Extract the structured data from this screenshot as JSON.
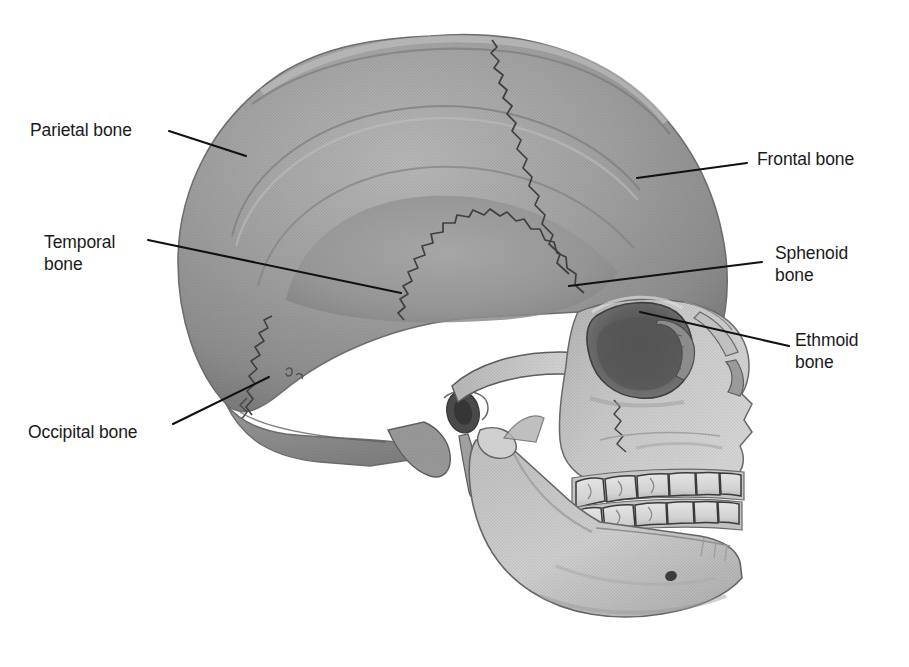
{
  "figure": {
    "type": "anatomical-illustration",
    "style": "grayscale halftone medical illustration",
    "orientation": "left lateral view, facing right",
    "background_color": "#ffffff",
    "line_color": "#111111",
    "text_color": "#1a1a1a",
    "tones": {
      "cranium_main": "#9b9b9b",
      "cranium_highlight": "#b0b0b0",
      "cranium_shadow": "#7d7d7d",
      "temporal_fossa": "#8d8d8d",
      "facial_bone_light": "#c9c9c9",
      "orbit_dark": "#5e5e5e",
      "tooth": "#dcdcdc",
      "suture": "#4a4a4a"
    }
  },
  "labels": [
    {
      "id": "parietal",
      "text": "Parietal bone",
      "side": "left",
      "text_x": 30,
      "text_y": 119,
      "leader": {
        "x1": 169,
        "y1": 131,
        "x2": 246,
        "y2": 156
      }
    },
    {
      "id": "temporal",
      "text": "Temporal\nbone",
      "side": "left",
      "text_x": 44,
      "text_y": 231,
      "leader": {
        "x1": 148,
        "y1": 240,
        "x2": 401,
        "y2": 293
      }
    },
    {
      "id": "occipital",
      "text": "Occipital bone",
      "side": "left",
      "text_x": 28,
      "text_y": 421,
      "leader": {
        "x1": 173,
        "y1": 424,
        "x2": 269,
        "y2": 377
      }
    },
    {
      "id": "frontal",
      "text": "Frontal bone",
      "side": "right",
      "text_x": 757,
      "text_y": 148,
      "leader": {
        "x1": 637,
        "y1": 178,
        "x2": 747,
        "y2": 163
      }
    },
    {
      "id": "sphenoid",
      "text": "Sphenoid\nbone",
      "side": "right",
      "text_x": 775,
      "text_y": 242,
      "leader": {
        "x1": 569,
        "y1": 286,
        "x2": 762,
        "y2": 262
      }
    },
    {
      "id": "ethmoid",
      "text": "Ethmoid\nbone",
      "side": "right",
      "text_x": 795,
      "text_y": 329,
      "leader": {
        "x1": 640,
        "y1": 312,
        "x2": 789,
        "y2": 346
      }
    }
  ],
  "anatomy_notes": {
    "sutures_visible": [
      "coronal suture",
      "squamous suture",
      "lambdoid suture"
    ],
    "features_visible": [
      "orbit",
      "zygomatic arch",
      "maxilla",
      "mandible",
      "upper teeth row",
      "lower teeth row",
      "mental foramen",
      "mastoid process",
      "styloid process",
      "external auditory meatus",
      "nasal bone",
      "temporal lines"
    ]
  }
}
